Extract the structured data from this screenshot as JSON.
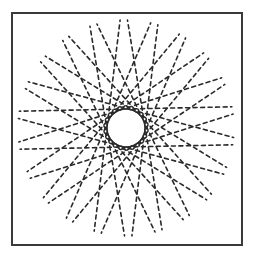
{
  "figure": {
    "type": "dashed tangent-line starburst stimulus",
    "frame_color": "#3a3a3a",
    "dash_color": "#2a2a2a",
    "center": [
      126,
      128
    ],
    "inner_hole_radius": 19,
    "outer_radius": 108,
    "line_count": 22,
    "dash_length": 4,
    "dash_gap": 3.5,
    "dash_width": 1.6,
    "rotation_offset_deg": 7
  }
}
